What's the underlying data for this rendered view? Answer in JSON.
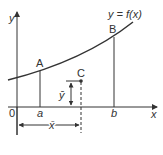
{
  "diagram": {
    "curve_label": "y = f(x)",
    "axes": {
      "x_label": "x",
      "y_label": "y",
      "origin_label": "0"
    },
    "points": {
      "A": "A",
      "B": "B",
      "C": "C"
    },
    "ticks": {
      "a": "a",
      "b": "b"
    },
    "centroid": {
      "x_bar": "x̄",
      "y_bar": "ȳ"
    },
    "colors": {
      "line": "#333333",
      "background": "#ffffff"
    }
  }
}
